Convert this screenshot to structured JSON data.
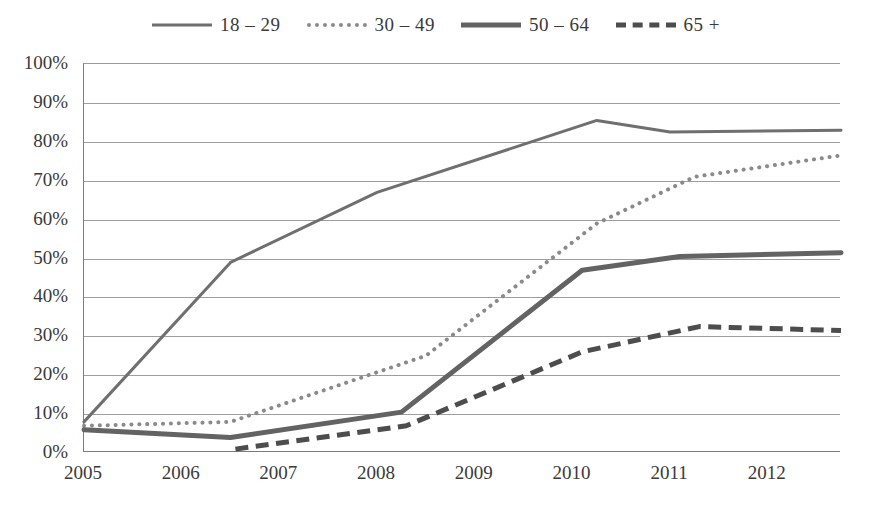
{
  "chart_data": {
    "type": "line",
    "title": "",
    "subtitle": "",
    "xlabel": "",
    "ylabel": "",
    "xlim": [
      2005.0,
      2012.75
    ],
    "ylim": [
      0,
      100
    ],
    "grid": true,
    "legend_position": "top-center",
    "x_ticks": [
      "2005",
      "2006",
      "2007",
      "2008",
      "2009",
      "2010",
      "2011",
      "2012"
    ],
    "x_tick_values": [
      2005,
      2006,
      2007,
      2008,
      2009,
      2010,
      2011,
      2012
    ],
    "y_ticks": [
      "0%",
      "10%",
      "20%",
      "30%",
      "40%",
      "50%",
      "60%",
      "70%",
      "80%",
      "90%",
      "100%"
    ],
    "y_tick_values": [
      0,
      10,
      20,
      30,
      40,
      50,
      60,
      70,
      80,
      90,
      100
    ],
    "series": [
      {
        "name": "18 – 29",
        "style": "solid",
        "color": "#6f6f6f",
        "width": 3,
        "x": [
          2005.0,
          2006.5,
          2008.0,
          2010.25,
          2011.0,
          2012.75
        ],
        "values": [
          8,
          49,
          67,
          85.5,
          82.5,
          83
        ]
      },
      {
        "name": "30 – 49",
        "style": "dotted",
        "color": "#8a8a8a",
        "width": 4,
        "x": [
          2005.0,
          2006.5,
          2008.5,
          2010.25,
          2011.25,
          2012.75
        ],
        "values": [
          7,
          8,
          25,
          59,
          71,
          76.5
        ]
      },
      {
        "name": "50 – 64",
        "style": "solid",
        "color": "#636363",
        "width": 5,
        "x": [
          2005.0,
          2006.5,
          2008.25,
          2010.1,
          2011.1,
          2012.75
        ],
        "values": [
          6,
          4,
          10.5,
          47,
          50.5,
          51.5
        ]
      },
      {
        "name": "65 +",
        "style": "dashed",
        "color": "#4d4d4d",
        "width": 5,
        "x": [
          2006.55,
          2008.3,
          2010.1,
          2011.3,
          2012.75
        ],
        "values": [
          1,
          7,
          26,
          32.5,
          31.5
        ]
      }
    ]
  },
  "legend": {
    "items": [
      {
        "label": "18 – 29",
        "swatch": "solid-medium-line-swatch"
      },
      {
        "label": "30 – 49",
        "swatch": "dotted-line-swatch"
      },
      {
        "label": "50 – 64",
        "swatch": "solid-bold-line-swatch"
      },
      {
        "label": "65 +",
        "swatch": "dashed-line-swatch"
      }
    ]
  },
  "colors": {
    "background": "#ffffff",
    "axis": "#7d7d7d",
    "gridline": "#9e9e9e",
    "text": "#3a3a3a"
  }
}
